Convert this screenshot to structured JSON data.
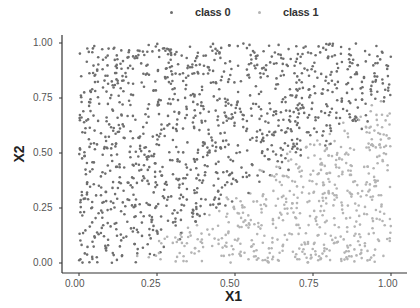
{
  "chart_data": {
    "type": "scatter",
    "title": "",
    "xlabel": "X1",
    "ylabel": "X2",
    "xlim": [
      0,
      1
    ],
    "ylim": [
      0,
      1
    ],
    "xticks": [
      "0.00",
      "0.25",
      "0.50",
      "0.75",
      "1.00"
    ],
    "yticks": [
      "0.00",
      "0.25",
      "0.50",
      "0.75",
      "1.00"
    ],
    "grid": false,
    "legend_position": "top",
    "series": [
      {
        "name": "class 0",
        "color": "#6e6e6e",
        "region": "upper-left, above a diagonal boundary roughly from (0.2, 0.0) to (1.0, 0.75)",
        "approx_count": 850
      },
      {
        "name": "class 1",
        "color": "#b4b4b4",
        "region": "lower-right, below the diagonal boundary",
        "approx_count": 850
      }
    ],
    "point_count_estimate": 1700,
    "boundary_description": "class 0 dominates where X2 > ~0.9*X1 - 0.15; class 1 dominates elsewhere"
  },
  "legend": {
    "items": [
      {
        "label": "class 0",
        "color": "#6e6e6e"
      },
      {
        "label": "class 1",
        "color": "#b4b4b4"
      }
    ]
  },
  "axes": {
    "x": {
      "title": "X1",
      "ticks": [
        "0.00",
        "0.25",
        "0.50",
        "0.75",
        "1.00"
      ]
    },
    "y": {
      "title": "X2",
      "ticks": [
        "0.00",
        "0.25",
        "0.50",
        "0.75",
        "1.00"
      ]
    }
  }
}
